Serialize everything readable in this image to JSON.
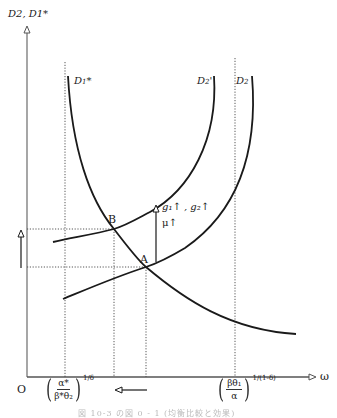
{
  "figure": {
    "y_axis_label": "D2, D1*",
    "x_axis_label": "ω",
    "origin_label": "O",
    "curves": [
      {
        "id": "D1star",
        "label": "D1*",
        "label_main": "D",
        "label_sub": "1",
        "label_sup": "*",
        "shape": "downward-sloping"
      },
      {
        "id": "D2prime",
        "label": "D2'",
        "label_main": "D",
        "label_sub": "2",
        "label_sup": "'",
        "shape": "upward-sloping"
      },
      {
        "id": "D2",
        "label": "D2",
        "label_main": "D",
        "label_sub": "2",
        "label_sup": "",
        "shape": "upward-sloping"
      }
    ],
    "points": [
      {
        "label": "B",
        "description": "intersection of D1* and D2'"
      },
      {
        "label": "A",
        "description": "intersection of D1* and D2"
      }
    ],
    "shift_annotation": {
      "line1": "g₁↑ , g₂↑",
      "line2": "μ↑"
    },
    "x_tick_left": {
      "numerator": "α*",
      "denominator": "β*θ₂",
      "exponent": "1/δ"
    },
    "x_tick_right": {
      "numerator": "βθ₁",
      "denominator": "α",
      "exponent": "1/(1-δ)"
    },
    "arrows": [
      {
        "direction": "up",
        "meaning": "equilibrium D rises"
      },
      {
        "direction": "left",
        "meaning": "equilibrium ω falls"
      }
    ],
    "caption": "図 10-3  の図 0 - 1  (均衡比較と効果)"
  }
}
